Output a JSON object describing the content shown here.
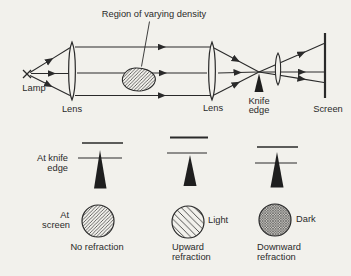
{
  "colors": {
    "background": "#f2f1ec",
    "ink": "#2a2a2a"
  },
  "optical": {
    "region_label": "Region of varying density",
    "lamp_label": "Lamp",
    "lens1_label": "Lens",
    "lens2_label": "Lens",
    "knife_label_1": "Knife",
    "knife_label_2": "edge",
    "screen_label": "Screen"
  },
  "knife_row": {
    "label_1": "At knife",
    "label_2": "edge"
  },
  "screen_row": {
    "label_1": "At",
    "label_2": "screen"
  },
  "cases": [
    {
      "caption_1": "No refraction",
      "caption_2": "",
      "result": "",
      "appearance": "medium-diagonal-hatch"
    },
    {
      "caption_1": "Upward",
      "caption_2": "refraction",
      "result": "Light",
      "appearance": "sparse-diagonal-hatch"
    },
    {
      "caption_1": "Downward",
      "caption_2": "refraction",
      "result": "Dark",
      "appearance": "dense-cross-hatch"
    }
  ]
}
